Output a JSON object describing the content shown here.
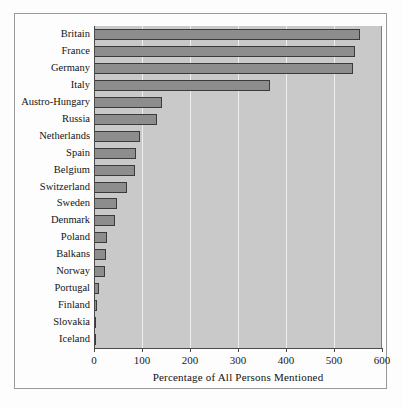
{
  "chart_data": {
    "type": "bar",
    "orientation": "horizontal",
    "title": "",
    "xlabel": "Percentage of All Persons Mentioned",
    "ylabel": "",
    "xlim": [
      0,
      600
    ],
    "ylim": null,
    "grid": "vertical-gridlines-at-xticks",
    "legend": "none",
    "xticks": [
      0,
      100,
      200,
      300,
      400,
      500,
      600
    ],
    "xtick_labels": [
      "0",
      "100",
      "200",
      "300",
      "400",
      "500",
      "600"
    ],
    "categories": [
      "Britain",
      "France",
      "Germany",
      "Italy",
      "Austro-Hungary",
      "Russia",
      "Netherlands",
      "Spain",
      "Belgium",
      "Switzerland",
      "Sweden",
      "Denmark",
      "Poland",
      "Balkans",
      "Norway",
      "Portugal",
      "Finland",
      "Slovakia",
      "Iceland"
    ],
    "values": [
      554,
      544,
      540,
      367,
      142,
      131,
      96,
      88,
      85,
      69,
      48,
      44,
      27,
      25,
      23,
      11,
      7,
      5,
      1
    ],
    "colors": {
      "bar_fill": "#8d8d8d",
      "bar_edge": "#3a3a3a",
      "panel_background": "#c9c9c9",
      "gridline": "#eeeeee",
      "axis": "#4a4a4a",
      "figure_background": "#fdfdfd",
      "text": "#141414"
    }
  }
}
